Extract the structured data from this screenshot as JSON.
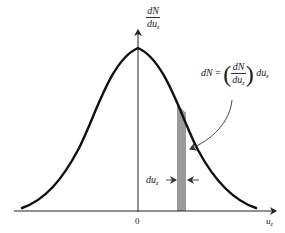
{
  "diagram": {
    "type": "gaussian-distribution",
    "y_axis_label": {
      "num": "dN",
      "den": "du",
      "den_sub": "z"
    },
    "x_axis_label": {
      "base": "u",
      "sub": "z"
    },
    "origin_label": "0",
    "strip_width_label": {
      "base": "du",
      "sub": "z"
    },
    "formula": {
      "lhs": "dN",
      "equals": "=",
      "frac_num": "dN",
      "frac_den": "du",
      "frac_den_sub": "z",
      "rhs": "du",
      "rhs_sub": "z"
    },
    "colors": {
      "curve": "#111111",
      "axis": "#222222",
      "strip": "#9a9a9a",
      "background": "#ffffff"
    }
  }
}
